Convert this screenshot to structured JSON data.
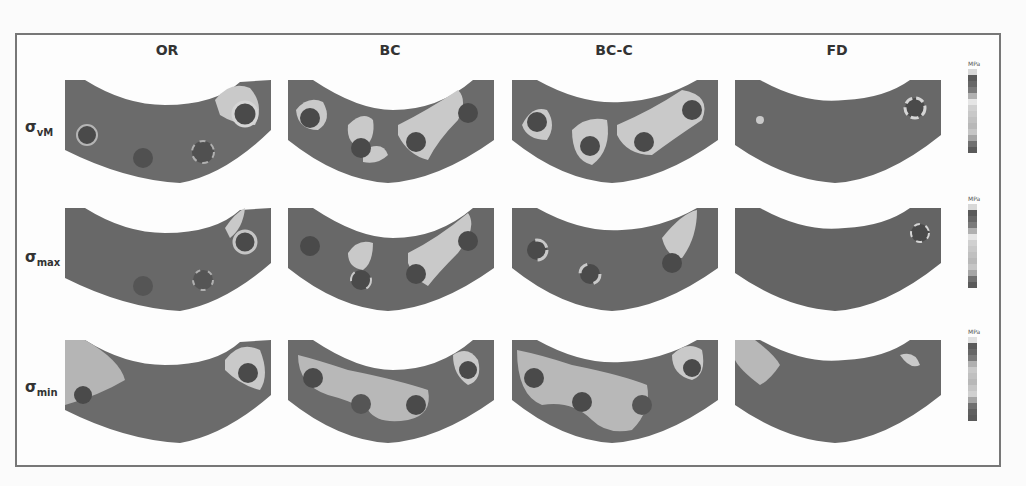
{
  "figure": {
    "columns": [
      "OR",
      "BC",
      "BC-C",
      "FD"
    ],
    "rows": [
      {
        "symbol": "σ",
        "subscript": "vM"
      },
      {
        "symbol": "σ",
        "subscript": "max"
      },
      {
        "symbol": "σ",
        "subscript": "min"
      }
    ],
    "legend_unit": "MPa",
    "colors": {
      "frame": "#777777",
      "panel_base": "#6b6b6b",
      "panel_dark": "#555555",
      "high_stress": "#c9c9c9",
      "hole": "#4a4a4a"
    }
  }
}
